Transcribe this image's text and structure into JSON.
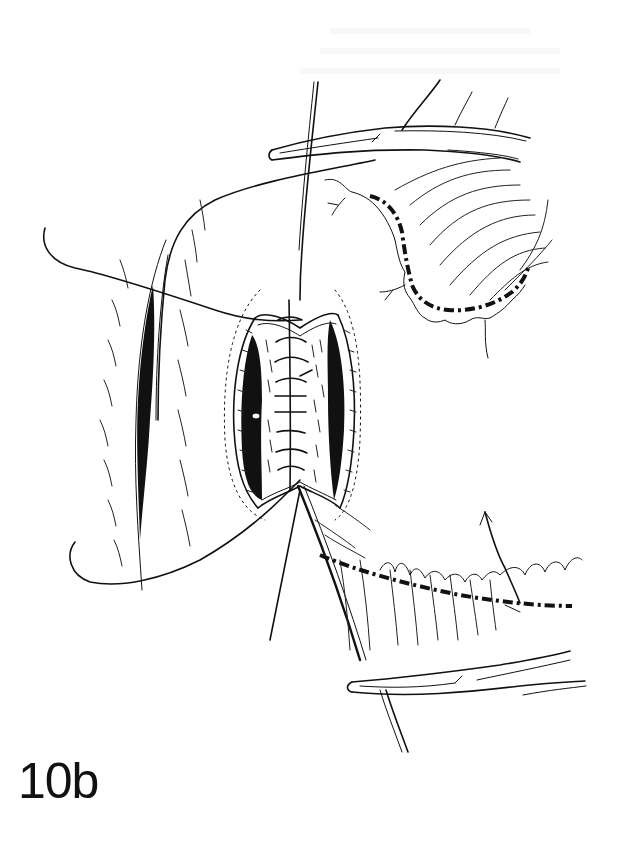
{
  "figure": {
    "label": "10b",
    "type": "surgical line illustration",
    "colors": {
      "ink": "#111111",
      "background": "#ffffff"
    },
    "elements": [
      {
        "name": "upper-hemostat-clamp",
        "description": "curved clamp at top, pointing left"
      },
      {
        "name": "lower-hemostat-clamp",
        "description": "curved clamp at bottom, pointing left"
      },
      {
        "name": "central-incision",
        "description": "open oval incision with transverse sutures along a midline"
      },
      {
        "name": "left-lateral-incision",
        "description": "narrow vertical slit on left"
      },
      {
        "name": "suture-threads",
        "description": "long suture strands looping left and running vertically"
      },
      {
        "name": "upper-right-tissue-flap",
        "description": "fan of tissue with dashed vessel arc"
      },
      {
        "name": "lower-right-vessel",
        "description": "dashed vessel running horizontally to the right"
      }
    ]
  }
}
